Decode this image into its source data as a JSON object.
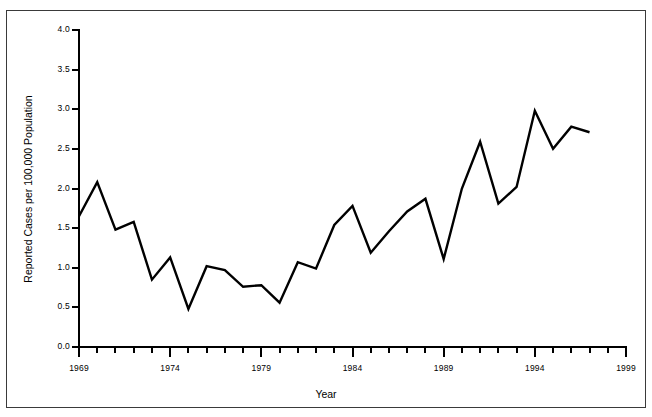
{
  "chart_data": {
    "type": "line",
    "title": "",
    "xlabel": "Year",
    "ylabel": "Reported Cases per 100,000 Population",
    "xlim": [
      1969,
      1999
    ],
    "ylim": [
      0.0,
      4.0
    ],
    "grid": false,
    "legend": null,
    "x_tick_labels": [
      "1969",
      "1974",
      "1979",
      "1984",
      "1989",
      "1994",
      "1999"
    ],
    "x_tick_values": [
      1969,
      1974,
      1979,
      1984,
      1989,
      1994,
      1999
    ],
    "y_tick_labels": [
      "0.0",
      "0.5",
      "1.0",
      "1.5",
      "2.0",
      "2.5",
      "3.0",
      "3.5",
      "4.0"
    ],
    "y_tick_values": [
      0.0,
      0.5,
      1.0,
      1.5,
      2.0,
      2.5,
      3.0,
      3.5,
      4.0
    ],
    "x": [
      1969,
      1970,
      1971,
      1972,
      1973,
      1974,
      1975,
      1976,
      1977,
      1978,
      1979,
      1980,
      1981,
      1982,
      1983,
      1984,
      1985,
      1986,
      1987,
      1988,
      1989,
      1990,
      1991,
      1992,
      1993,
      1994,
      1995,
      1996,
      1997,
      1998,
      1999
    ],
    "values": [
      1.65,
      2.08,
      1.48,
      1.58,
      0.85,
      1.13,
      0.48,
      1.02,
      0.97,
      0.76,
      0.78,
      0.56,
      1.07,
      0.99,
      1.54,
      1.78,
      1.19,
      1.46,
      1.71,
      1.87,
      1.11,
      2.0,
      2.59,
      1.81,
      2.02,
      2.98,
      2.5,
      2.78,
      2.71,
      null,
      null
    ],
    "series": [
      {
        "name": "Reported Cases per 100,000 Population",
        "color": "#000000",
        "points": [
          {
            "x": 1969,
            "y": 1.65
          },
          {
            "x": 1970,
            "y": 2.08
          },
          {
            "x": 1971,
            "y": 1.48
          },
          {
            "x": 1972,
            "y": 1.58
          },
          {
            "x": 1973,
            "y": 0.85
          },
          {
            "x": 1974,
            "y": 1.13
          },
          {
            "x": 1975,
            "y": 0.48
          },
          {
            "x": 1976,
            "y": 1.02
          },
          {
            "x": 1977,
            "y": 0.97
          },
          {
            "x": 1978,
            "y": 0.76
          },
          {
            "x": 1979,
            "y": 0.78
          },
          {
            "x": 1980,
            "y": 0.56
          },
          {
            "x": 1981,
            "y": 1.07
          },
          {
            "x": 1982,
            "y": 0.99
          },
          {
            "x": 1983,
            "y": 1.54
          },
          {
            "x": 1984,
            "y": 1.78
          },
          {
            "x": 1985,
            "y": 1.19
          },
          {
            "x": 1986,
            "y": 1.46
          },
          {
            "x": 1987,
            "y": 1.71
          },
          {
            "x": 1988,
            "y": 1.87
          },
          {
            "x": 1989,
            "y": 1.11
          },
          {
            "x": 1990,
            "y": 2.0
          },
          {
            "x": 1991,
            "y": 2.59
          },
          {
            "x": 1992,
            "y": 1.81
          },
          {
            "x": 1993,
            "y": 2.02
          },
          {
            "x": 1994,
            "y": 2.98
          },
          {
            "x": 1995,
            "y": 2.5
          },
          {
            "x": 1996,
            "y": 2.78
          },
          {
            "x": 1997,
            "y": 2.71
          }
        ]
      }
    ]
  },
  "axis": {
    "x_title": "Year",
    "y_title": "Reported Cases per 100,000 Population"
  },
  "style": {
    "line_color": "#000000",
    "axis_color": "#000000",
    "frame_color": "#3a3a3a",
    "background": "#ffffff",
    "line_width": 2.4
  }
}
